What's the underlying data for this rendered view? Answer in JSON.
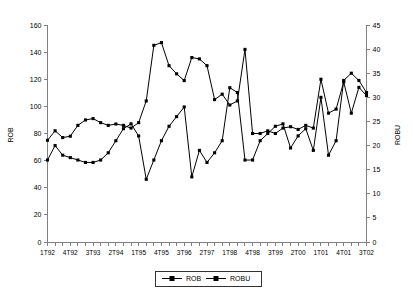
{
  "chart_data": {
    "type": "line",
    "title": "",
    "xlabel": "",
    "ylabel": "ROB",
    "y2label": "ROBU",
    "ylim": [
      0,
      160
    ],
    "y2lim": [
      0,
      45
    ],
    "yticks": [
      0,
      20,
      40,
      60,
      80,
      100,
      120,
      140,
      160
    ],
    "y2ticks": [
      0,
      5,
      10,
      15,
      20,
      25,
      30,
      35,
      40,
      45
    ],
    "grid": false,
    "legend_position": "bottom-center",
    "legend": [
      "ROB",
      "ROBU"
    ],
    "x": [
      "1T92",
      "2T92",
      "3T92",
      "4T92",
      "1T93",
      "2T93",
      "3T93",
      "4T93",
      "1T94",
      "2T94",
      "3T94",
      "4T94",
      "1T95",
      "2T95",
      "3T95",
      "4T95",
      "1T96",
      "2T96",
      "3T96",
      "4T96",
      "1T97",
      "2T97",
      "3T97",
      "4T97",
      "1T98",
      "2T98",
      "3T98",
      "4T98",
      "1T99",
      "2T99",
      "3T99",
      "4T99",
      "1T00",
      "2T00",
      "3T00",
      "4T00",
      "1T01",
      "2T01",
      "3T01",
      "4T01",
      "1T02",
      "2T02",
      "3T02"
    ],
    "xtick_labels": [
      "1T92",
      "4T92",
      "3T93",
      "2T94",
      "1T95",
      "4T95",
      "3T96",
      "2T97",
      "1T98",
      "4T98",
      "3T99",
      "2T00",
      "1T01",
      "4T01",
      "3T02"
    ],
    "xtick_indices": [
      0,
      3,
      6,
      9,
      12,
      15,
      18,
      21,
      24,
      27,
      30,
      33,
      36,
      39,
      42
    ],
    "series": [
      {
        "name": "ROB",
        "axis": "left",
        "values": [
          75,
          82,
          77,
          78,
          86,
          90,
          91,
          88,
          86,
          87,
          86,
          84,
          88,
          104,
          145,
          147,
          130,
          124,
          119,
          136,
          135,
          130,
          105,
          109,
          101,
          104,
          142,
          80,
          80,
          82,
          80,
          84,
          85,
          83,
          86,
          84,
          120,
          95,
          98,
          118,
          95,
          114,
          108
        ]
      },
      {
        "name": "ROBU",
        "axis": "right",
        "values": [
          17,
          20,
          18,
          17.5,
          17,
          16.5,
          16.5,
          17,
          18.5,
          21,
          23.5,
          24.5,
          22,
          13,
          17,
          21,
          24,
          26,
          28,
          13.5,
          19,
          16.5,
          18.5,
          21,
          32,
          31,
          17,
          17,
          21,
          22.5,
          24,
          24.5,
          19.5,
          22,
          23.5,
          19,
          30,
          18,
          21,
          33.5,
          35,
          33.5,
          31
        ]
      }
    ]
  },
  "axis": {
    "left_title": "ROB",
    "right_title": "ROBU"
  }
}
